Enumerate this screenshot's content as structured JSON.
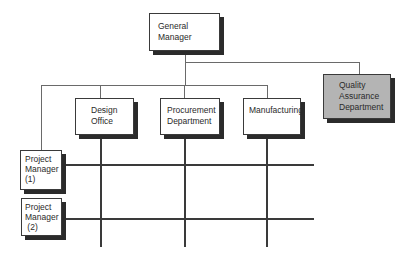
{
  "diagram": {
    "type": "matrix-organization-chart",
    "nodes": {
      "general_manager": {
        "line1": "General",
        "line2": "Manager"
      },
      "quality_assurance": {
        "line1": "Quality",
        "line2": "Assurance",
        "line3": "Department"
      },
      "design_office": {
        "line1": "Design",
        "line2": "Office"
      },
      "procurement": {
        "line1": "Procurement",
        "line2": "Department"
      },
      "manufacturing": {
        "line1": "Manufacturing"
      },
      "project_manager_1": {
        "line1": "Project",
        "line2": "Manager",
        "line3": "(1)"
      },
      "project_manager_2": {
        "line1": "Project",
        "line2": "Manager",
        "line3": " (2)"
      }
    },
    "colors": {
      "box_fill": "#ffffff",
      "qa_fill": "#b4b4b4",
      "shadow": "#2b2b2b",
      "line": "#555555"
    }
  }
}
